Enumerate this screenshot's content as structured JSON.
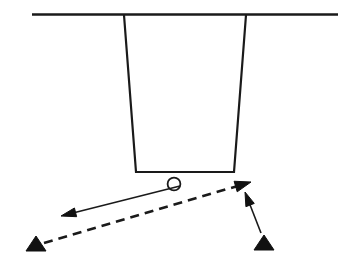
{
  "figure": {
    "type": "line-diagram",
    "canvas": {
      "width": 347,
      "height": 267,
      "background": "#ffffff"
    },
    "stroke_color": "#1a1a1a",
    "fill_color": "#111111",
    "elements": {
      "ground_line": {
        "label": "ground-line",
        "x1": 32,
        "y1": 14.5,
        "x2": 338,
        "y2": 14.5,
        "stroke_width": 2.6
      },
      "hopper": {
        "label": "funnel-hopper",
        "top_left": [
          124,
          15
        ],
        "top_right": [
          246,
          15
        ],
        "bottom_right": [
          234,
          172
        ],
        "bottom_left": [
          136,
          172
        ],
        "stroke_width": 2.2
      },
      "particle": {
        "label": "particle-circle",
        "cx": 174,
        "cy": 184,
        "r": 6.4,
        "stroke_width": 1.8
      },
      "solid_arrow_left": {
        "label": "leftward-solid-arrow",
        "from": [
          180,
          186
        ],
        "to": [
          61,
          216
        ],
        "stroke_width": 1.6,
        "head_length": 15,
        "head_width": 9
      },
      "dashed_arrow": {
        "label": "dashed-arrow",
        "from": [
          44,
          243
        ],
        "to": [
          251,
          182
        ],
        "stroke_width": 2.6,
        "dash_pattern": "9 6",
        "head_length": 16,
        "head_width": 11
      },
      "solid_arrow_up": {
        "label": "upward-solid-arrow",
        "from": [
          261,
          233
        ],
        "to": [
          245,
          192
        ],
        "stroke_width": 1.6,
        "head_length": 14,
        "head_width": 9
      },
      "triangle_left": {
        "label": "left-support-triangle",
        "apex": [
          36,
          236
        ],
        "base_left": [
          26,
          251
        ],
        "base_right": [
          46,
          251
        ]
      },
      "triangle_right": {
        "label": "right-support-triangle",
        "apex": [
          264,
          235
        ],
        "base_left": [
          254,
          250
        ],
        "base_right": [
          274,
          250
        ]
      }
    }
  }
}
